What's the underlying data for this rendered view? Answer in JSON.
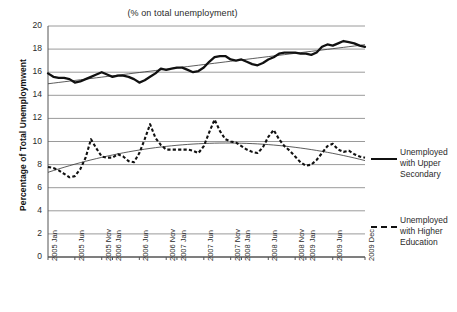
{
  "chart_data": {
    "type": "line",
    "title": "(% on total unemployment)",
    "xlabel": "",
    "ylabel": "Percentage of Total Unemploymwent",
    "ylim": [
      0,
      20
    ],
    "ytick_values": [
      0,
      2,
      4,
      6,
      8,
      10,
      12,
      14,
      16,
      18,
      20
    ],
    "grid": true,
    "legend_position": "right",
    "xtick_labels": [
      "2005 Jan",
      "2005 Jun",
      "2005 Nov",
      "2006 Jan",
      "2006 Jun",
      "2006 Nov",
      "2007 Jan",
      "2007 Jun",
      "2007 Nov",
      "2008 Jan",
      "2008 Jun",
      "2008 Nov",
      "2009 Jan",
      "2009 Jun",
      "2009 Dec"
    ],
    "xtick_index": [
      0,
      5,
      10,
      12,
      17,
      22,
      24,
      29,
      34,
      36,
      41,
      46,
      48,
      53,
      59
    ],
    "x": [
      "2005-01",
      "2005-02",
      "2005-03",
      "2005-04",
      "2005-05",
      "2005-06",
      "2005-07",
      "2005-08",
      "2005-09",
      "2005-10",
      "2005-11",
      "2005-12",
      "2006-01",
      "2006-02",
      "2006-03",
      "2006-04",
      "2006-05",
      "2006-06",
      "2006-07",
      "2006-08",
      "2006-09",
      "2006-10",
      "2006-11",
      "2006-12",
      "2007-01",
      "2007-02",
      "2007-03",
      "2007-04",
      "2007-05",
      "2007-06",
      "2007-07",
      "2007-08",
      "2007-09",
      "2007-10",
      "2007-11",
      "2007-12",
      "2008-01",
      "2008-02",
      "2008-03",
      "2008-04",
      "2008-05",
      "2008-06",
      "2008-07",
      "2008-08",
      "2008-09",
      "2008-10",
      "2008-11",
      "2008-12",
      "2009-01",
      "2009-02",
      "2009-03",
      "2009-04",
      "2009-05",
      "2009-06",
      "2009-07",
      "2009-08",
      "2009-09",
      "2009-10",
      "2009-11",
      "2009-12"
    ],
    "series": [
      {
        "name": "Unemployed with Upper Secondary",
        "style": "solid",
        "color": "#111111",
        "values": [
          15.9,
          15.6,
          15.5,
          15.5,
          15.4,
          15.1,
          15.2,
          15.4,
          15.6,
          15.8,
          16.0,
          15.8,
          15.6,
          15.7,
          15.7,
          15.6,
          15.4,
          15.1,
          15.3,
          15.6,
          15.9,
          16.3,
          16.2,
          16.3,
          16.4,
          16.4,
          16.2,
          16.0,
          16.1,
          16.4,
          16.9,
          17.3,
          17.4,
          17.4,
          17.1,
          17.0,
          17.1,
          16.9,
          16.7,
          16.6,
          16.8,
          17.1,
          17.3,
          17.6,
          17.7,
          17.7,
          17.7,
          17.6,
          17.6,
          17.5,
          17.7,
          18.2,
          18.4,
          18.3,
          18.5,
          18.7,
          18.6,
          18.5,
          18.3,
          18.2
        ],
        "trend": "linear, rising from ~15.4 to ~18.9"
      },
      {
        "name": "Unemployed with Higher Education",
        "style": "dashed",
        "color": "#111111",
        "values": [
          7.8,
          7.7,
          7.5,
          7.2,
          6.9,
          7.0,
          7.6,
          8.6,
          10.2,
          9.4,
          8.7,
          8.6,
          8.6,
          8.9,
          8.7,
          8.3,
          8.2,
          9.0,
          10.2,
          11.5,
          10.3,
          9.7,
          9.3,
          9.3,
          9.3,
          9.3,
          9.3,
          9.2,
          9.0,
          9.6,
          10.8,
          11.9,
          10.9,
          10.2,
          10.0,
          9.9,
          9.6,
          9.3,
          9.1,
          9.0,
          9.5,
          10.4,
          11.0,
          10.2,
          9.6,
          9.2,
          8.7,
          8.2,
          7.9,
          8.0,
          8.4,
          9.0,
          9.6,
          9.8,
          9.3,
          9.1,
          9.2,
          8.9,
          8.7,
          8.6
        ],
        "trend": "polynomial, rising from ~7.2 to peak ~10.0 around 2007 then falling to ~7.6"
      }
    ]
  },
  "legend": {
    "items": [
      {
        "id": "upper-secondary",
        "style": "solid",
        "lines": [
          "Unemployed",
          "with Upper",
          "Secondary"
        ]
      },
      {
        "id": "higher-education",
        "style": "dashed",
        "lines": [
          "Unemployed",
          "with Higher",
          "Education"
        ]
      }
    ]
  }
}
